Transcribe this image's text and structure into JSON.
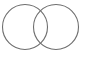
{
  "diagram": {
    "type": "venn",
    "stroke_color": "#6e6e6e",
    "background": "#ffffff",
    "circles": [
      {
        "name": "left-set",
        "cx": 25,
        "cy": 27,
        "r": 22.5
      },
      {
        "name": "right-set",
        "cx": 56,
        "cy": 27,
        "r": 22.5
      }
    ]
  }
}
